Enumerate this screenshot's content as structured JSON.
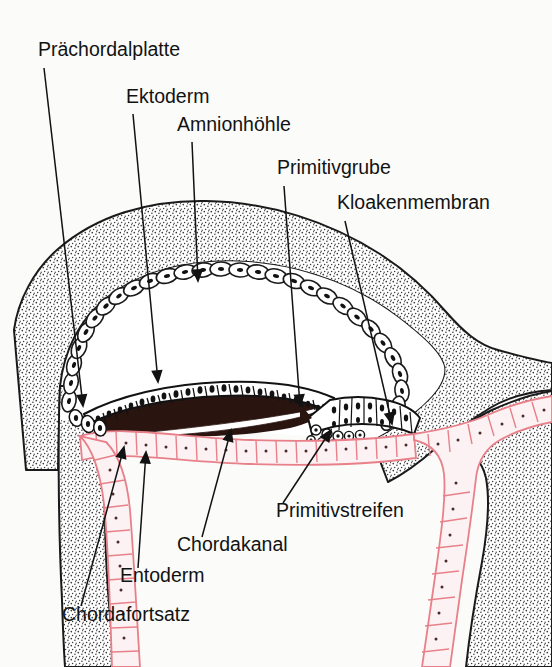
{
  "figure": {
    "kind": "anatomical-diagram",
    "language": "de",
    "background_color": "#fbfbf9",
    "ink_color": "#121212",
    "endoderm_color": "#e8808a",
    "endoderm_fill": "#fdf2f3",
    "chord_fill": "#2a1410",
    "stipple_color": "#3a3a3a",
    "labels": [
      {
        "id": "praechordalplatte",
        "text": "Prächordalplatte",
        "text_x": 38,
        "text_y": 56,
        "anchor": "start",
        "leader": [
          [
            44,
            68
          ],
          [
            83,
            406
          ]
        ],
        "arrow": true,
        "arrow_angle": 83
      },
      {
        "id": "ektoderm",
        "text": "Ektoderm",
        "text_x": 126,
        "text_y": 103,
        "anchor": "start",
        "leader": [
          [
            133,
            114
          ],
          [
            158,
            382
          ]
        ],
        "arrow": true,
        "arrow_angle": 84
      },
      {
        "id": "amnionhoehle",
        "text": "Amnionhöhle",
        "text_x": 177,
        "text_y": 131,
        "anchor": "start",
        "leader": [
          [
            192,
            142
          ],
          [
            198,
            281
          ]
        ],
        "arrow": true,
        "arrow_angle": 88
      },
      {
        "id": "primitivgrube",
        "text": "Primitivgrube",
        "text_x": 277,
        "text_y": 174,
        "anchor": "start",
        "leader": [
          [
            284,
            186
          ],
          [
            300,
            406
          ]
        ],
        "arrow": true,
        "arrow_angle": 86
      },
      {
        "id": "kloakenmembran",
        "text": "Kloakenmembran",
        "text_x": 337,
        "text_y": 209,
        "anchor": "start",
        "leader": [
          [
            345,
            221
          ],
          [
            392,
            424
          ]
        ],
        "arrow": true,
        "arrow_angle": 77
      },
      {
        "id": "primitivstreifen",
        "text": "Primitivstreifen",
        "text_x": 276,
        "text_y": 517,
        "anchor": "start",
        "leader": [
          [
            283,
            503
          ],
          [
            331,
            430
          ]
        ],
        "arrow": true,
        "arrow_angle": -123
      },
      {
        "id": "chordakanal",
        "text": "Chordakanal",
        "text_x": 177,
        "text_y": 551,
        "anchor": "start",
        "leader": [
          [
            202,
            537
          ],
          [
            231,
            430
          ]
        ],
        "arrow": true,
        "arrow_angle": -105
      },
      {
        "id": "entoderm",
        "text": "Entoderm",
        "text_x": 120,
        "text_y": 582,
        "anchor": "start",
        "leader": [
          [
            138,
            568
          ],
          [
            146,
            452
          ]
        ],
        "arrow": true,
        "arrow_angle": -94
      },
      {
        "id": "chordafortsatz",
        "text": "Chordafortsatz",
        "text_x": 62,
        "text_y": 621,
        "anchor": "start",
        "leader": [
          [
            81,
            606
          ],
          [
            124,
            447
          ]
        ],
        "arrow": true,
        "arrow_angle": -105
      }
    ]
  },
  "structures": {
    "amnion_cavity": "Amnionhöhle",
    "ectoderm": "Ektoderm",
    "endoderm": "Entoderm",
    "chordal_process": "Chordafortsatz",
    "chordal_canal": "Chordakanal",
    "primitive_streak": "Primitivstreifen",
    "primitive_pit": "Primitivgrube",
    "prechordal_plate": "Prächordalplatte",
    "cloacal_membrane": "Kloakenmembran"
  }
}
